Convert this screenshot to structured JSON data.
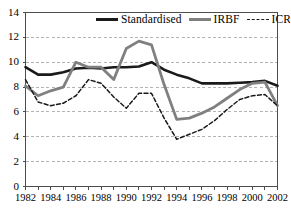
{
  "chart_data": {
    "type": "line",
    "title": "",
    "xlabel": "",
    "ylabel": "",
    "xlim": [
      1982,
      2002
    ],
    "ylim": [
      0,
      14
    ],
    "ytick_values": [
      0,
      2,
      4,
      6,
      8,
      10,
      12,
      14
    ],
    "ytick_labels": [
      "0",
      "2",
      "4",
      "6",
      "8",
      "10",
      "12",
      "14"
    ],
    "xtick_values": [
      1982,
      1983,
      1984,
      1985,
      1986,
      1987,
      1988,
      1989,
      1990,
      1991,
      1992,
      1993,
      1994,
      1995,
      1996,
      1997,
      1998,
      1999,
      2000,
      2001,
      2002
    ],
    "xtick_labels_shown": [
      "1982",
      "1984",
      "1986",
      "1988",
      "1990",
      "1992",
      "1994",
      "1996",
      "1998",
      "2000",
      "2002"
    ],
    "grid": true,
    "grid_axis": "y",
    "legend_position": "top-right",
    "x": [
      1982,
      1983,
      1984,
      1985,
      1986,
      1987,
      1988,
      1989,
      1990,
      1991,
      1992,
      1993,
      1994,
      1995,
      1996,
      1997,
      1998,
      1999,
      2000,
      2001,
      2002
    ],
    "series": [
      {
        "name": "Standardised",
        "style": "solid",
        "color": "#1a1a1a",
        "width": 2.6,
        "values": [
          9.6,
          9.0,
          9.0,
          9.2,
          9.5,
          9.55,
          9.5,
          9.6,
          9.6,
          9.65,
          10.0,
          9.4,
          9.0,
          8.7,
          8.3,
          8.3,
          8.3,
          8.35,
          8.4,
          8.5,
          8.1
        ]
      },
      {
        "name": "IRBF",
        "style": "solid",
        "color": "#808080",
        "width": 2.8,
        "values": [
          8.1,
          7.3,
          7.7,
          8.0,
          10.0,
          9.6,
          9.6,
          8.6,
          11.1,
          11.7,
          11.4,
          8.2,
          5.4,
          5.5,
          5.9,
          6.4,
          7.1,
          7.8,
          8.3,
          8.4,
          6.5
        ]
      },
      {
        "name": "ICRM",
        "style": "dashed",
        "color": "#1a1a1a",
        "width": 1.5,
        "values": [
          8.6,
          6.8,
          6.5,
          6.7,
          7.3,
          8.6,
          8.3,
          7.2,
          6.3,
          7.5,
          7.5,
          5.5,
          3.8,
          4.2,
          4.6,
          5.3,
          6.2,
          7.0,
          7.3,
          7.4,
          6.5
        ]
      }
    ]
  },
  "legend": {
    "items": [
      {
        "label": "Standardised"
      },
      {
        "label": "IRBF"
      },
      {
        "label": "ICRM"
      }
    ]
  },
  "colors": {
    "standardised": "#1a1a1a",
    "irbf": "#808080",
    "icrm": "#1a1a1a",
    "grid": "#b3b3b3",
    "axis": "#4d4d4d",
    "background": "#ffffff"
  }
}
